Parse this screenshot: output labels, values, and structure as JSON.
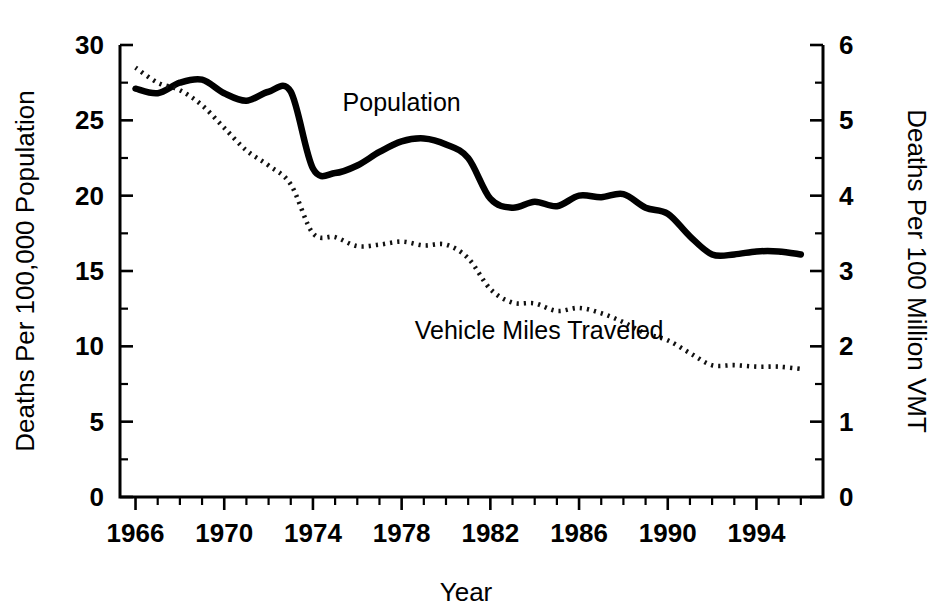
{
  "chart_data": {
    "type": "line",
    "title": "",
    "subtitle": "",
    "xlabel": "Year",
    "ylabel": "Deaths Per 100,000 Population",
    "ylabel_right": "Deaths Per 100 Million VMT",
    "xlim": [
      1965.3,
      1997.0
    ],
    "ylim": [
      0,
      30
    ],
    "ylim_right": [
      0,
      6
    ],
    "grid": false,
    "legend_position": "inline-annotation",
    "x_ticks_major": [
      1966,
      1970,
      1974,
      1978,
      1982,
      1986,
      1990,
      1994
    ],
    "x_tick_labels": [
      "1966",
      "1970",
      "1974",
      "1978",
      "1982",
      "1986",
      "1990",
      "1994"
    ],
    "x_tick_minor_step": 1,
    "y_ticks_left": [
      0,
      5,
      10,
      15,
      20,
      25,
      30
    ],
    "y_tick_labels_left": [
      "0",
      "5",
      "10",
      "15",
      "20",
      "25",
      "30"
    ],
    "y_ticks_right": [
      0,
      1,
      2,
      3,
      4,
      5,
      6
    ],
    "y_tick_labels_right": [
      "0",
      "1",
      "2",
      "3",
      "4",
      "5",
      "6"
    ],
    "y_tick_minor_step_left": 2.5,
    "y_tick_minor_step_right": 0.5,
    "x": [
      1966,
      1967,
      1968,
      1969,
      1970,
      1971,
      1972,
      1973,
      1974,
      1975,
      1976,
      1977,
      1978,
      1979,
      1980,
      1981,
      1982,
      1983,
      1984,
      1985,
      1986,
      1987,
      1988,
      1989,
      1990,
      1991,
      1992,
      1993,
      1994,
      1995,
      1996
    ],
    "series": [
      {
        "name": "Population",
        "axis": "left",
        "style": "solid",
        "label_x": 1978.0,
        "label_y": 25.6,
        "values": [
          27.1,
          26.8,
          27.5,
          27.7,
          26.8,
          26.3,
          26.9,
          26.9,
          21.8,
          21.5,
          22.0,
          22.9,
          23.6,
          23.8,
          23.4,
          22.5,
          19.8,
          19.2,
          19.6,
          19.3,
          20.0,
          19.9,
          20.1,
          19.2,
          18.8,
          17.3,
          16.1,
          16.1,
          16.3,
          16.3,
          16.1
        ]
      },
      {
        "name": "Vehicle Miles Traveled",
        "axis": "right",
        "style": "dotted",
        "label_x": 1984.2,
        "label_y": 10.5,
        "values": [
          5.7,
          5.5,
          5.4,
          5.2,
          4.9,
          4.6,
          4.4,
          4.15,
          3.5,
          3.45,
          3.33,
          3.35,
          3.39,
          3.34,
          3.35,
          3.17,
          2.76,
          2.58,
          2.57,
          2.47,
          2.51,
          2.44,
          2.32,
          2.17,
          2.08,
          1.91,
          1.75,
          1.75,
          1.73,
          1.73,
          1.7
        ]
      }
    ]
  },
  "figure": {
    "x_axis_title": "Year",
    "y_axis_title_left": "Deaths Per 100,000 Population",
    "y_axis_title_right": "Deaths Per 100 Million VMT",
    "annotation_population": "Population",
    "annotation_vmt": "Vehicle Miles Traveled"
  }
}
